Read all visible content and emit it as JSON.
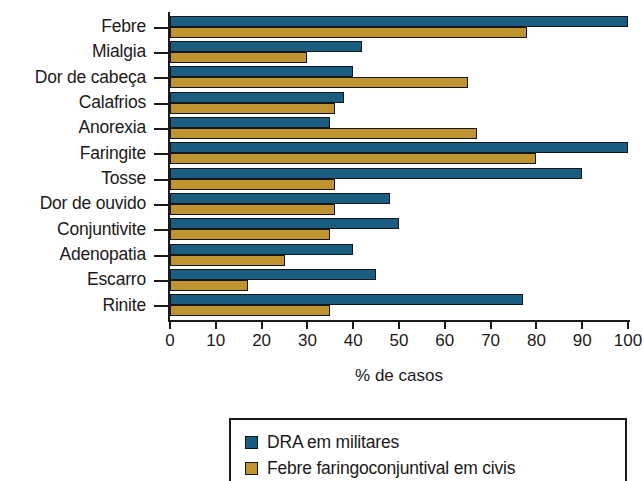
{
  "chart_data": {
    "type": "bar",
    "orientation": "horizontal",
    "title": "",
    "xlabel": "% de casos",
    "ylabel": "",
    "xlim": [
      0,
      100
    ],
    "xticks": [
      0,
      10,
      20,
      30,
      40,
      50,
      60,
      70,
      80,
      90,
      100
    ],
    "grid": false,
    "legend_position": "bottom",
    "categories": [
      "Febre",
      "Mialgia",
      "Dor de cabeça",
      "Calafrios",
      "Anorexia",
      "Faringite",
      "Tosse",
      "Dor de ouvido",
      "Conjuntivite",
      "Adenopatia",
      "Escarro",
      "Rinite"
    ],
    "series": [
      {
        "name": "DRA em militares",
        "color": "#1b5d80",
        "values": [
          100,
          42,
          40,
          38,
          35,
          100,
          90,
          48,
          50,
          40,
          45,
          77
        ]
      },
      {
        "name": "Febre faringoconjuntival em civis",
        "color": "#bf932f",
        "values": [
          78,
          30,
          65,
          36,
          67,
          80,
          36,
          36,
          35,
          25,
          17,
          35
        ]
      }
    ]
  },
  "axis": {
    "x_title": "% de casos",
    "tick_labels": [
      "0",
      "10",
      "20",
      "30",
      "40",
      "50",
      "60",
      "70",
      "80",
      "90",
      "100"
    ]
  },
  "legend": {
    "items": [
      {
        "label": "DRA em militares",
        "color": "#1b5d80"
      },
      {
        "label": "Febre faringoconjuntival em civis",
        "color": "#bf932f"
      }
    ]
  }
}
